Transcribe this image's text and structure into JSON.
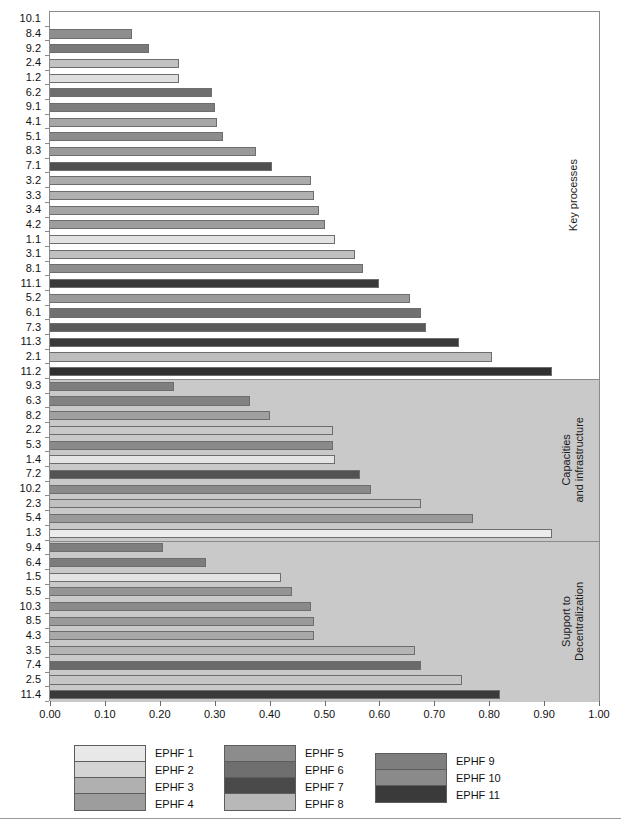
{
  "chart_data": {
    "type": "bar",
    "orientation": "horizontal",
    "title": "",
    "xlabel": "",
    "ylabel": "",
    "xlim": [
      0.0,
      1.0
    ],
    "xticks": [
      "0.00",
      "0.10",
      "0.20",
      "0.30",
      "0.40",
      "0.50",
      "0.60",
      "0.70",
      "0.80",
      "0.90",
      "1.00"
    ],
    "grid": false,
    "legend_position": "bottom",
    "legend": [
      {
        "name": "EPHF 1",
        "color": "#e8e8e8"
      },
      {
        "name": "EPHF 2",
        "color": "#d4d4d4"
      },
      {
        "name": "EPHF 3",
        "color": "#b0b0b0"
      },
      {
        "name": "EPHF 4",
        "color": "#9d9d9d"
      },
      {
        "name": "EPHF 5",
        "color": "#8c8c8c"
      },
      {
        "name": "EPHF 6",
        "color": "#6f6f6f"
      },
      {
        "name": "EPHF 7",
        "color": "#4a4a4a"
      },
      {
        "name": "EPHF 8",
        "color": "#b8b8b8"
      },
      {
        "name": "EPHF 9",
        "color": "#7e7e7e"
      },
      {
        "name": "EPHF 10",
        "color": "#8a8a8a"
      },
      {
        "name": "EPHF 11",
        "color": "#3a3a3a"
      }
    ],
    "sections": [
      {
        "label": "Key processes",
        "shaded": false,
        "bars": [
          {
            "category": "10.1",
            "value": 0.0,
            "series": "EPHF 10",
            "color": "#8a8a8a"
          },
          {
            "category": "8.4",
            "value": 0.15,
            "series": "EPHF 8",
            "color": "#8e8e8e"
          },
          {
            "category": "9.2",
            "value": 0.18,
            "series": "EPHF 9",
            "color": "#7a7a7a"
          },
          {
            "category": "2.4",
            "value": 0.235,
            "series": "EPHF 2",
            "color": "#c2c2c2"
          },
          {
            "category": "1.2",
            "value": 0.235,
            "series": "EPHF 1",
            "color": "#dedede"
          },
          {
            "category": "6.2",
            "value": 0.295,
            "series": "EPHF 6",
            "color": "#6f6f6f"
          },
          {
            "category": "9.1",
            "value": 0.3,
            "series": "EPHF 9",
            "color": "#7e7e7e"
          },
          {
            "category": "4.1",
            "value": 0.305,
            "series": "EPHF 4",
            "color": "#a7a7a7"
          },
          {
            "category": "5.1",
            "value": 0.315,
            "series": "EPHF 5",
            "color": "#8c8c8c"
          },
          {
            "category": "8.3",
            "value": 0.375,
            "series": "EPHF 8",
            "color": "#9a9a9a"
          },
          {
            "category": "7.1",
            "value": 0.405,
            "series": "EPHF 7",
            "color": "#4f4f4f"
          },
          {
            "category": "3.2",
            "value": 0.475,
            "series": "EPHF 3",
            "color": "#ababab"
          },
          {
            "category": "3.3",
            "value": 0.48,
            "series": "EPHF 3",
            "color": "#b0b0b0"
          },
          {
            "category": "3.4",
            "value": 0.49,
            "series": "EPHF 3",
            "color": "#a4a4a4"
          },
          {
            "category": "4.2",
            "value": 0.5,
            "series": "EPHF 4",
            "color": "#9d9d9d"
          },
          {
            "category": "1.1",
            "value": 0.52,
            "series": "EPHF 1",
            "color": "#e2e2e2"
          },
          {
            "category": "3.1",
            "value": 0.555,
            "series": "EPHF 3",
            "color": "#c0c0c0"
          },
          {
            "category": "8.1",
            "value": 0.57,
            "series": "EPHF 8",
            "color": "#8e8e8e"
          },
          {
            "category": "11.1",
            "value": 0.6,
            "series": "EPHF 11",
            "color": "#3a3a3a"
          },
          {
            "category": "5.2",
            "value": 0.655,
            "series": "EPHF 5",
            "color": "#9a9a9a"
          },
          {
            "category": "6.1",
            "value": 0.675,
            "series": "EPHF 6",
            "color": "#707070"
          },
          {
            "category": "7.3",
            "value": 0.685,
            "series": "EPHF 7",
            "color": "#5a5a5a"
          },
          {
            "category": "11.3",
            "value": 0.745,
            "series": "EPHF 11",
            "color": "#3a3a3a"
          },
          {
            "category": "2.1",
            "value": 0.805,
            "series": "EPHF 2",
            "color": "#bdbdbd"
          },
          {
            "category": "11.2",
            "value": 0.915,
            "series": "EPHF 11",
            "color": "#2f2f2f"
          }
        ]
      },
      {
        "label": "Capacities\nand infrastructure",
        "shaded": true,
        "bars": [
          {
            "category": "9.3",
            "value": 0.225,
            "series": "EPHF 9",
            "color": "#7e7e7e"
          },
          {
            "category": "6.3",
            "value": 0.365,
            "series": "EPHF 6",
            "color": "#828282"
          },
          {
            "category": "8.2",
            "value": 0.4,
            "series": "EPHF 8",
            "color": "#a0a0a0"
          },
          {
            "category": "2.2",
            "value": 0.515,
            "series": "EPHF 2",
            "color": "#c8c8c8"
          },
          {
            "category": "5.3",
            "value": 0.515,
            "series": "EPHF 5",
            "color": "#8a8a8a"
          },
          {
            "category": "1.4",
            "value": 0.52,
            "series": "EPHF 1",
            "color": "#e4e4e4"
          },
          {
            "category": "7.2",
            "value": 0.565,
            "series": "EPHF 7",
            "color": "#535353"
          },
          {
            "category": "10.2",
            "value": 0.585,
            "series": "EPHF 10",
            "color": "#8a8a8a"
          },
          {
            "category": "2.3",
            "value": 0.675,
            "series": "EPHF 2",
            "color": "#c0c0c0"
          },
          {
            "category": "5.4",
            "value": 0.77,
            "series": "EPHF 5",
            "color": "#9a9a9a"
          },
          {
            "category": "1.3",
            "value": 0.915,
            "series": "EPHF 1",
            "color": "#ececec"
          }
        ]
      },
      {
        "label": "Support to\nDecentralization",
        "shaded": true,
        "bars": [
          {
            "category": "9.4",
            "value": 0.205,
            "series": "EPHF 9",
            "color": "#7e7e7e"
          },
          {
            "category": "6.4",
            "value": 0.285,
            "series": "EPHF 6",
            "color": "#7c7c7c"
          },
          {
            "category": "1.5",
            "value": 0.42,
            "series": "EPHF 1",
            "color": "#e4e4e4"
          },
          {
            "category": "5.5",
            "value": 0.44,
            "series": "EPHF 5",
            "color": "#949494"
          },
          {
            "category": "10.3",
            "value": 0.475,
            "series": "EPHF 10",
            "color": "#8a8a8a"
          },
          {
            "category": "8.5",
            "value": 0.48,
            "series": "EPHF 8",
            "color": "#9a9a9a"
          },
          {
            "category": "4.3",
            "value": 0.48,
            "series": "EPHF 4",
            "color": "#a8a8a8"
          },
          {
            "category": "3.5",
            "value": 0.665,
            "series": "EPHF 3",
            "color": "#b4b4b4"
          },
          {
            "category": "7.4",
            "value": 0.675,
            "series": "EPHF 7",
            "color": "#6a6a6a"
          },
          {
            "category": "2.5",
            "value": 0.75,
            "series": "EPHF 2",
            "color": "#c6c6c6"
          },
          {
            "category": "11.4",
            "value": 0.82,
            "series": "EPHF 11",
            "color": "#3a3a3a"
          }
        ]
      }
    ]
  },
  "legend_groups": [
    {
      "items": [
        0,
        1,
        2,
        3
      ]
    },
    {
      "items": [
        4,
        5,
        6,
        7
      ]
    },
    {
      "items": [
        8,
        9,
        10
      ]
    }
  ],
  "colors": {
    "axis": "#8a8a8a",
    "shaded_band": "#c9c9c9",
    "plot_background": "#ffffff",
    "bar_border": "#6d6d6d",
    "text": "#111111"
  }
}
